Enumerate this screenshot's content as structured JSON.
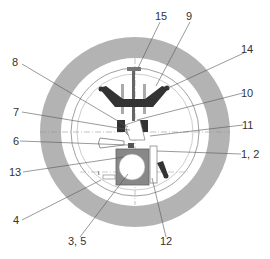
{
  "diagram": {
    "type": "technical cross-section",
    "labels": [
      {
        "id": "l15",
        "text": "15"
      },
      {
        "id": "l9",
        "text": "9"
      },
      {
        "id": "l14",
        "text": "14"
      },
      {
        "id": "l8",
        "text": "8"
      },
      {
        "id": "l10",
        "text": "10"
      },
      {
        "id": "l7",
        "text": "7"
      },
      {
        "id": "l11",
        "text": "11"
      },
      {
        "id": "l6",
        "text": "6"
      },
      {
        "id": "l12a",
        "text": "1, 2"
      },
      {
        "id": "l13",
        "text": "13"
      },
      {
        "id": "l4",
        "text": "4"
      },
      {
        "id": "l35",
        "text": "3, 5"
      },
      {
        "id": "l12",
        "text": "12"
      }
    ],
    "colors": {
      "ring": "#b0b0b0",
      "dark_part": "#3a3a3a",
      "line": "#555555",
      "centerline": "#999999"
    }
  }
}
